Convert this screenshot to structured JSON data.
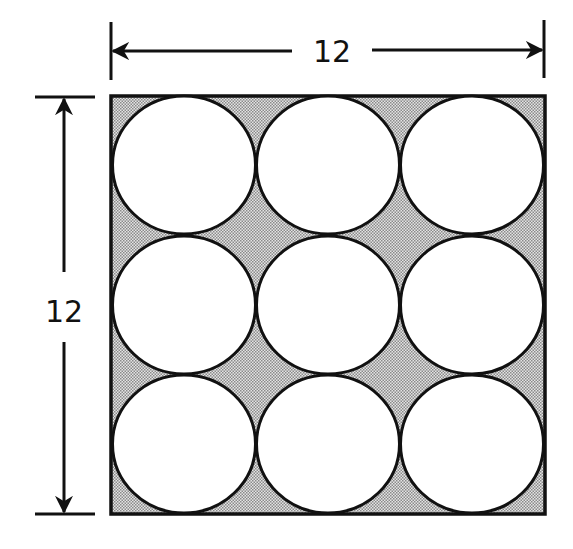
{
  "diagram": {
    "square": {
      "side_length": "12"
    },
    "grid": {
      "rows": 3,
      "cols": 3,
      "circle_count": 9
    },
    "dimensions": {
      "top": {
        "label": "12",
        "orientation": "horizontal"
      },
      "left": {
        "label": "12",
        "orientation": "vertical"
      }
    },
    "colors": {
      "stroke": "#111111",
      "shade": "#c8c8c8",
      "circle_fill": "#ffffff",
      "background": "#ffffff"
    }
  }
}
